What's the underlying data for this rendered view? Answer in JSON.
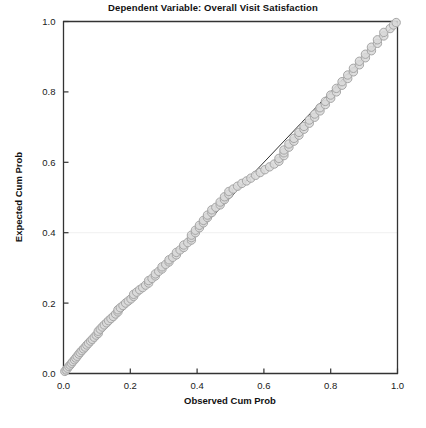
{
  "chart_data": {
    "type": "scatter",
    "title": "Dependent Variable: Overall Visit Satisfaction",
    "xlabel": "Observed Cum Prob",
    "ylabel": "Expected Cum Prob",
    "xlim": [
      0.0,
      1.0
    ],
    "ylim": [
      0.0,
      1.0
    ],
    "xticks": [
      "0.0",
      "0.2",
      "0.4",
      "0.6",
      "0.8",
      "1.0"
    ],
    "yticks": [
      "0.0",
      "0.2",
      "0.4",
      "0.6",
      "0.8",
      "1.0"
    ],
    "xtick_values": [
      0.0,
      0.2,
      0.4,
      0.6,
      0.8,
      1.0
    ],
    "ytick_values": [
      0.0,
      0.2,
      0.4,
      0.6,
      0.8,
      1.0
    ],
    "grid": false,
    "legend": "none",
    "marker": {
      "shape": "circle",
      "fill": "#d9d9d9",
      "stroke": "#a6a6a6",
      "radius": 4.2,
      "opacity": 0.85
    },
    "reference_line": {
      "label": "diagonal reference line",
      "from": [
        0.0,
        0.0
      ],
      "to": [
        1.0,
        1.0
      ],
      "color": "#333333",
      "width": 1.0
    },
    "series": [
      {
        "name": "Observed vs Expected Cum Prob",
        "points": [
          [
            0.004,
            0.006
          ],
          [
            0.008,
            0.01
          ],
          [
            0.012,
            0.015
          ],
          [
            0.016,
            0.02
          ],
          [
            0.02,
            0.024
          ],
          [
            0.024,
            0.029
          ],
          [
            0.028,
            0.034
          ],
          [
            0.033,
            0.039
          ],
          [
            0.037,
            0.044
          ],
          [
            0.041,
            0.049
          ],
          [
            0.046,
            0.055
          ],
          [
            0.05,
            0.06
          ],
          [
            0.055,
            0.065
          ],
          [
            0.06,
            0.07
          ],
          [
            0.065,
            0.075
          ],
          [
            0.07,
            0.081
          ],
          [
            0.075,
            0.086
          ],
          [
            0.081,
            0.092
          ],
          [
            0.086,
            0.097
          ],
          [
            0.092,
            0.103
          ],
          [
            0.098,
            0.109
          ],
          [
            0.104,
            0.114
          ],
          [
            0.104,
            0.12
          ],
          [
            0.11,
            0.126
          ],
          [
            0.116,
            0.132
          ],
          [
            0.122,
            0.138
          ],
          [
            0.129,
            0.144
          ],
          [
            0.135,
            0.15
          ],
          [
            0.142,
            0.156
          ],
          [
            0.149,
            0.162
          ],
          [
            0.156,
            0.169
          ],
          [
            0.163,
            0.175
          ],
          [
            0.163,
            0.181
          ],
          [
            0.17,
            0.187
          ],
          [
            0.178,
            0.193
          ],
          [
            0.186,
            0.2
          ],
          [
            0.194,
            0.206
          ],
          [
            0.202,
            0.212
          ],
          [
            0.21,
            0.219
          ],
          [
            0.21,
            0.225
          ],
          [
            0.219,
            0.231
          ],
          [
            0.228,
            0.238
          ],
          [
            0.237,
            0.244
          ],
          [
            0.246,
            0.251
          ],
          [
            0.255,
            0.257
          ],
          [
            0.255,
            0.264
          ],
          [
            0.265,
            0.27
          ],
          [
            0.275,
            0.277
          ],
          [
            0.275,
            0.283
          ],
          [
            0.285,
            0.29
          ],
          [
            0.295,
            0.297
          ],
          [
            0.295,
            0.303
          ],
          [
            0.306,
            0.31
          ],
          [
            0.316,
            0.317
          ],
          [
            0.316,
            0.323
          ],
          [
            0.327,
            0.33
          ],
          [
            0.338,
            0.337
          ],
          [
            0.338,
            0.344
          ],
          [
            0.349,
            0.351
          ],
          [
            0.36,
            0.358
          ],
          [
            0.36,
            0.365
          ],
          [
            0.372,
            0.372
          ],
          [
            0.383,
            0.379
          ],
          [
            0.383,
            0.386
          ],
          [
            0.383,
            0.393
          ],
          [
            0.395,
            0.4
          ],
          [
            0.395,
            0.407
          ],
          [
            0.407,
            0.414
          ],
          [
            0.407,
            0.421
          ],
          [
            0.419,
            0.428
          ],
          [
            0.419,
            0.435
          ],
          [
            0.431,
            0.443
          ],
          [
            0.431,
            0.45
          ],
          [
            0.444,
            0.457
          ],
          [
            0.444,
            0.465
          ],
          [
            0.456,
            0.472
          ],
          [
            0.469,
            0.479
          ],
          [
            0.469,
            0.487
          ],
          [
            0.482,
            0.494
          ],
          [
            0.482,
            0.502
          ],
          [
            0.495,
            0.509
          ],
          [
            0.495,
            0.517
          ],
          [
            0.508,
            0.524
          ],
          [
            0.521,
            0.532
          ],
          [
            0.534,
            0.54
          ],
          [
            0.548,
            0.547
          ],
          [
            0.561,
            0.555
          ],
          [
            0.575,
            0.563
          ],
          [
            0.589,
            0.571
          ],
          [
            0.603,
            0.579
          ],
          [
            0.617,
            0.587
          ],
          [
            0.631,
            0.595
          ],
          [
            0.645,
            0.603
          ],
          [
            0.645,
            0.611
          ],
          [
            0.66,
            0.619
          ],
          [
            0.66,
            0.627
          ],
          [
            0.66,
            0.635
          ],
          [
            0.675,
            0.643
          ],
          [
            0.675,
            0.652
          ],
          [
            0.69,
            0.66
          ],
          [
            0.69,
            0.668
          ],
          [
            0.705,
            0.677
          ],
          [
            0.705,
            0.685
          ],
          [
            0.72,
            0.694
          ],
          [
            0.72,
            0.702
          ],
          [
            0.736,
            0.711
          ],
          [
            0.736,
            0.72
          ],
          [
            0.752,
            0.728
          ],
          [
            0.752,
            0.737
          ],
          [
            0.768,
            0.746
          ],
          [
            0.768,
            0.755
          ],
          [
            0.784,
            0.764
          ],
          [
            0.784,
            0.773
          ],
          [
            0.8,
            0.782
          ],
          [
            0.8,
            0.791
          ],
          [
            0.817,
            0.8
          ],
          [
            0.817,
            0.81
          ],
          [
            0.834,
            0.819
          ],
          [
            0.834,
            0.829
          ],
          [
            0.851,
            0.838
          ],
          [
            0.851,
            0.848
          ],
          [
            0.868,
            0.857
          ],
          [
            0.868,
            0.867
          ],
          [
            0.886,
            0.877
          ],
          [
            0.886,
            0.887
          ],
          [
            0.904,
            0.897
          ],
          [
            0.904,
            0.907
          ],
          [
            0.922,
            0.917
          ],
          [
            0.922,
            0.927
          ],
          [
            0.94,
            0.938
          ],
          [
            0.94,
            0.948
          ],
          [
            0.959,
            0.959
          ],
          [
            0.959,
            0.969
          ],
          [
            0.978,
            0.98
          ],
          [
            0.988,
            0.99
          ],
          [
            0.996,
            0.997
          ]
        ]
      }
    ]
  }
}
